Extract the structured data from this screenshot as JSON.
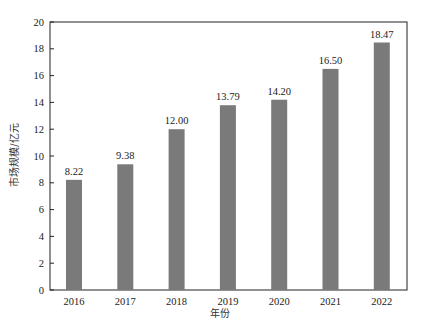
{
  "chart_data": {
    "type": "bar",
    "title": "",
    "xlabel": "年份",
    "ylabel": "市场规模/亿元",
    "categories": [
      "2016",
      "2017",
      "2018",
      "2019",
      "2020",
      "2021",
      "2022"
    ],
    "values": [
      8.22,
      9.38,
      12.0,
      13.79,
      14.2,
      16.5,
      18.47
    ],
    "data_labels": [
      "8.22",
      "9.38",
      "12.00",
      "13.79",
      "14.20",
      "16.50",
      "18.47"
    ],
    "ylim": [
      0,
      20
    ],
    "yticks": [
      "0",
      "2",
      "4",
      "6",
      "8",
      "10",
      "12",
      "14",
      "16",
      "18",
      "20"
    ],
    "grid": false,
    "legend": null,
    "bar_color": "#7a7a7a"
  }
}
